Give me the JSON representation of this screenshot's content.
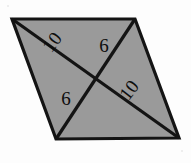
{
  "figure": {
    "kind": "rhombus-with-diagonals",
    "colors": {
      "background": "#fdfdfd",
      "fill": "#9a9a9a",
      "stroke": "#141414"
    },
    "stroke_width": 3.2,
    "vertices": [
      {
        "name": "top-left",
        "x": 12,
        "y": 19
      },
      {
        "name": "top-right",
        "x": 135,
        "y": 19
      },
      {
        "name": "bottom-right",
        "x": 179,
        "y": 138
      },
      {
        "name": "bottom-left",
        "x": 56,
        "y": 139
      }
    ],
    "diagonals": [
      {
        "name": "diagonal-top-left-to-bottom-right",
        "from": "top-left",
        "to": "bottom-right"
      },
      {
        "name": "diagonal-top-right-to-bottom-left",
        "from": "top-right",
        "to": "bottom-left"
      }
    ],
    "intersection": {
      "x": 95,
      "y": 78
    },
    "labels": [
      {
        "id": "label-upper-left",
        "text": "10",
        "x": 57,
        "y": 46,
        "rotation": -52
      },
      {
        "id": "label-upper-right",
        "text": "6",
        "x": 104,
        "y": 52,
        "rotation": 0
      },
      {
        "id": "label-lower-left",
        "text": "6",
        "x": 66,
        "y": 105,
        "rotation": 0
      },
      {
        "id": "label-lower-right",
        "text": "10",
        "x": 134,
        "y": 94,
        "rotation": -52
      }
    ]
  }
}
